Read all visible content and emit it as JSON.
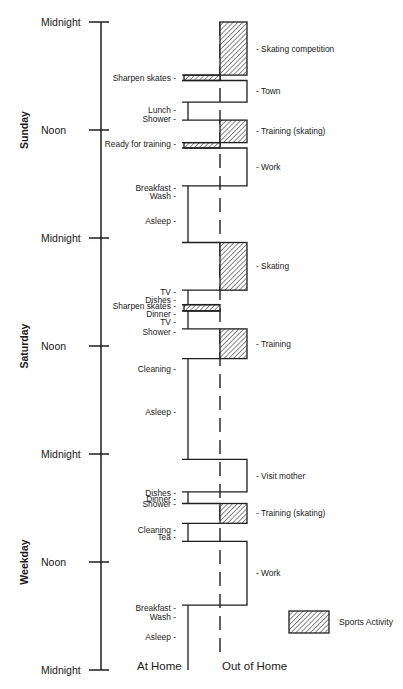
{
  "chart_data": {
    "type": "timeline",
    "title": "",
    "xlabel": "",
    "ylabel": "",
    "y_range_hours": [
      0,
      72
    ],
    "grid": false,
    "y_ticks": [
      {
        "label": "Midnight",
        "t": 0
      },
      {
        "label": "Noon",
        "t": 12
      },
      {
        "label": "Midnight",
        "t": 24
      },
      {
        "label": "Noon",
        "t": 36
      },
      {
        "label": "Midnight",
        "t": 48
      },
      {
        "label": "Noon",
        "t": 60
      },
      {
        "label": "Midnight",
        "t": 72
      }
    ],
    "days": [
      {
        "label": "Weekday",
        "center_t": 12
      },
      {
        "label": "Saturday",
        "center_t": 36
      },
      {
        "label": "Sunday",
        "center_t": 60
      }
    ],
    "columns": {
      "home": "At Home",
      "out": "Out of Home"
    },
    "legend": {
      "label": "Sports Activity",
      "pattern": "hatched",
      "position": "bottom-right"
    },
    "segments": [
      {
        "place": "home",
        "sport": false,
        "start": 0,
        "end": 7.2
      },
      {
        "place": "out",
        "sport": false,
        "start": 7.2,
        "end": 14.3,
        "label": "Work"
      },
      {
        "place": "home",
        "sport": false,
        "start": 14.3,
        "end": 16.3
      },
      {
        "place": "out",
        "sport": true,
        "start": 16.3,
        "end": 18.5,
        "label": "Training (skating)"
      },
      {
        "place": "home",
        "sport": false,
        "start": 18.5,
        "end": 19.8
      },
      {
        "place": "out",
        "sport": false,
        "start": 19.8,
        "end": 23.4,
        "label": "Visit mother"
      },
      {
        "place": "home",
        "sport": false,
        "start": 23.4,
        "end": 34.6
      },
      {
        "place": "out",
        "sport": true,
        "start": 34.6,
        "end": 37.9,
        "label": "Training"
      },
      {
        "place": "home",
        "sport": false,
        "start": 37.9,
        "end": 39.9
      },
      {
        "place": "home",
        "sport": true,
        "start": 39.9,
        "end": 40.6
      },
      {
        "place": "home",
        "sport": false,
        "start": 40.6,
        "end": 42.2
      },
      {
        "place": "out",
        "sport": true,
        "start": 42.2,
        "end": 47.5,
        "label": "Skating"
      },
      {
        "place": "home",
        "sport": false,
        "start": 47.5,
        "end": 53.8
      },
      {
        "place": "out",
        "sport": false,
        "start": 53.8,
        "end": 58.0,
        "label": "Work"
      },
      {
        "place": "home",
        "sport": true,
        "start": 58.0,
        "end": 58.6
      },
      {
        "place": "out",
        "sport": true,
        "start": 58.6,
        "end": 61.1,
        "label": "Training (skating)"
      },
      {
        "place": "home",
        "sport": false,
        "start": 61.1,
        "end": 63.1
      },
      {
        "place": "out",
        "sport": false,
        "start": 63.1,
        "end": 65.5,
        "label": "Town"
      },
      {
        "place": "home",
        "sport": true,
        "start": 65.5,
        "end": 66.1
      },
      {
        "place": "out",
        "sport": true,
        "start": 66.1,
        "end": 72.0,
        "label": "Skating competition"
      }
    ],
    "home_labels": [
      {
        "text": "Asleep",
        "t": 3.7
      },
      {
        "text": "Wash",
        "t": 5.9
      },
      {
        "text": "Breakfast",
        "t": 6.9
      },
      {
        "text": "Tea",
        "t": 14.8
      },
      {
        "text": "Cleaning",
        "t": 15.6
      },
      {
        "text": "Shower",
        "t": 18.4
      },
      {
        "text": "Dinner",
        "t": 19.0
      },
      {
        "text": "Dishes",
        "t": 19.7
      },
      {
        "text": "Asleep",
        "t": 28.7
      },
      {
        "text": "Cleaning",
        "t": 33.4
      },
      {
        "text": "Shower",
        "t": 37.6
      },
      {
        "text": "TV",
        "t": 38.7
      },
      {
        "text": "Dinner",
        "t": 39.6
      },
      {
        "text": "Sharpen skates",
        "t": 40.4
      },
      {
        "text": "Dishes",
        "t": 41.1
      },
      {
        "text": "TV",
        "t": 42.0
      },
      {
        "text": "Asleep",
        "t": 49.9
      },
      {
        "text": "Wash",
        "t": 52.7
      },
      {
        "text": "Breakfast",
        "t": 53.6
      },
      {
        "text": "Ready for training",
        "t": 58.4
      },
      {
        "text": "Shower",
        "t": 61.2
      },
      {
        "text": "Lunch",
        "t": 62.2
      },
      {
        "text": "Sharpen skates",
        "t": 65.8
      }
    ],
    "colors": {
      "ink": "#1e1e1e",
      "background": "#ffffff"
    }
  }
}
